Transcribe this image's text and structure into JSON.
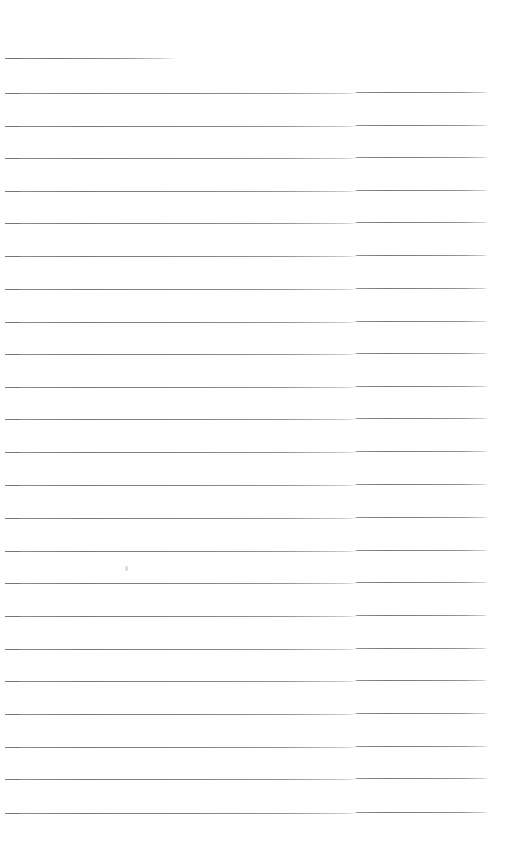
{
  "document": {
    "kind": "scanned-lined-paper",
    "title": "Blank lined paper (scan)",
    "page_width": 515,
    "page_height": 847,
    "background_color": "#ffffff",
    "rule_color": "#787880",
    "rule_color_light": "#b4b4bc",
    "rule_thickness": 1,
    "rule_count": 24,
    "first_rule_y": 58,
    "rule_spacing": 33.2,
    "content_left": 5,
    "content_right": 487,
    "scan_seam_x": 355,
    "scan_seam_offset": 1,
    "text_content": "",
    "note": "No handwriting or printed text present on the page."
  },
  "rules": [
    {
      "index": 1,
      "y": 58,
      "x_start": 5,
      "x_end": 175,
      "full_width": false,
      "seam": false
    },
    {
      "index": 2,
      "y": 93,
      "x_start": 5,
      "x_end": 487,
      "full_width": true,
      "seam": true
    },
    {
      "index": 3,
      "y": 126,
      "x_start": 5,
      "x_end": 487,
      "full_width": true,
      "seam": true
    },
    {
      "index": 4,
      "y": 158,
      "x_start": 5,
      "x_end": 487,
      "full_width": true,
      "seam": true
    },
    {
      "index": 5,
      "y": 191,
      "x_start": 5,
      "x_end": 487,
      "full_width": true,
      "seam": true
    },
    {
      "index": 6,
      "y": 223,
      "x_start": 5,
      "x_end": 487,
      "full_width": true,
      "seam": true
    },
    {
      "index": 7,
      "y": 256,
      "x_start": 5,
      "x_end": 487,
      "full_width": true,
      "seam": true
    },
    {
      "index": 8,
      "y": 289,
      "x_start": 5,
      "x_end": 487,
      "full_width": true,
      "seam": true
    },
    {
      "index": 9,
      "y": 322,
      "x_start": 5,
      "x_end": 487,
      "full_width": true,
      "seam": true
    },
    {
      "index": 10,
      "y": 354,
      "x_start": 5,
      "x_end": 487,
      "full_width": true,
      "seam": true
    },
    {
      "index": 11,
      "y": 387,
      "x_start": 5,
      "x_end": 487,
      "full_width": true,
      "seam": true
    },
    {
      "index": 12,
      "y": 419,
      "x_start": 5,
      "x_end": 487,
      "full_width": true,
      "seam": true
    },
    {
      "index": 13,
      "y": 452,
      "x_start": 5,
      "x_end": 487,
      "full_width": true,
      "seam": true
    },
    {
      "index": 14,
      "y": 485,
      "x_start": 5,
      "x_end": 487,
      "full_width": true,
      "seam": true
    },
    {
      "index": 15,
      "y": 518,
      "x_start": 5,
      "x_end": 487,
      "full_width": true,
      "seam": true
    },
    {
      "index": 16,
      "y": 551,
      "x_start": 5,
      "x_end": 487,
      "full_width": true,
      "seam": true
    },
    {
      "index": 17,
      "y": 583,
      "x_start": 5,
      "x_end": 487,
      "full_width": true,
      "seam": true
    },
    {
      "index": 18,
      "y": 616,
      "x_start": 5,
      "x_end": 487,
      "full_width": true,
      "seam": true
    },
    {
      "index": 19,
      "y": 649,
      "x_start": 5,
      "x_end": 487,
      "full_width": true,
      "seam": true
    },
    {
      "index": 20,
      "y": 681,
      "x_start": 5,
      "x_end": 487,
      "full_width": true,
      "seam": true
    },
    {
      "index": 21,
      "y": 714,
      "x_start": 5,
      "x_end": 487,
      "full_width": true,
      "seam": true
    },
    {
      "index": 22,
      "y": 747,
      "x_start": 5,
      "x_end": 487,
      "full_width": true,
      "seam": true
    },
    {
      "index": 23,
      "y": 779,
      "x_start": 5,
      "x_end": 487,
      "full_width": true,
      "seam": true
    },
    {
      "index": 24,
      "y": 813,
      "x_start": 5,
      "x_end": 487,
      "full_width": true,
      "seam": true
    }
  ],
  "artifacts": [
    {
      "name": "scan-speck",
      "x": 125,
      "y": 566,
      "width": 3,
      "height": 5
    }
  ]
}
